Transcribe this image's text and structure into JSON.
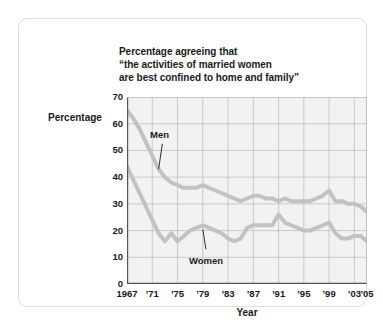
{
  "card": {
    "accent_line_color": "#b3b3b3",
    "plot_bg": "#f2f2f2",
    "grid_color": "#b9b9b9"
  },
  "chart_data": {
    "type": "line",
    "title_lines": [
      "Percentage agreeing that",
      "“the activities of married women",
      "are best confined to home and family”"
    ],
    "xlabel": "Year",
    "ylabel": "Percentage",
    "xlim": [
      1967,
      2005
    ],
    "ylim": [
      0,
      70
    ],
    "yticks": [
      70,
      60,
      50,
      40,
      30,
      20,
      10,
      0
    ],
    "ytick_labels": [
      "70",
      "60",
      "50",
      "40",
      "30",
      "20",
      "10",
      "0"
    ],
    "xticks": [
      1967,
      1971,
      1975,
      1979,
      1983,
      1987,
      1991,
      1995,
      1999,
      2003,
      2005
    ],
    "xtick_labels": [
      "1967",
      "’71",
      "’75",
      "’79",
      "’83",
      "’87",
      "’91",
      "’95",
      "’99",
      "’03",
      "’05"
    ],
    "grid": true,
    "grid_x_every": 4,
    "grid_y_every": 10,
    "legend_position": "inline-annotations",
    "annotations": [
      {
        "text": "Men",
        "x": 1972.6,
        "y": 52.5,
        "leader_to_x": 1972.0,
        "leader_to_y": 43.0
      },
      {
        "text": "Women",
        "x": 1979.5,
        "y": 13.0,
        "leader_to_x": 1979.0,
        "leader_to_y": 20.5
      }
    ],
    "series": [
      {
        "name": "Men",
        "color": "#c2c2c2",
        "x": [
          1967,
          1968,
          1969,
          1970,
          1971,
          1972,
          1973,
          1974,
          1975,
          1976,
          1977,
          1978,
          1979,
          1980,
          1981,
          1982,
          1983,
          1984,
          1985,
          1986,
          1987,
          1988,
          1989,
          1990,
          1991,
          1992,
          1993,
          1994,
          1995,
          1996,
          1997,
          1998,
          1999,
          2000,
          2001,
          2002,
          2003,
          2004,
          2005
        ],
        "values": [
          65,
          62,
          58,
          53,
          48,
          43,
          40,
          38,
          37,
          36,
          36,
          36,
          37,
          36,
          35,
          34,
          33,
          32,
          31,
          32,
          33,
          33,
          32,
          32,
          31,
          32,
          31,
          31,
          31,
          31,
          32,
          33,
          35,
          31,
          31,
          30,
          30,
          29,
          27
        ]
      },
      {
        "name": "Women",
        "color": "#c2c2c2",
        "x": [
          1967,
          1968,
          1969,
          1970,
          1971,
          1972,
          1973,
          1974,
          1975,
          1976,
          1977,
          1978,
          1979,
          1980,
          1981,
          1982,
          1983,
          1984,
          1985,
          1986,
          1987,
          1988,
          1989,
          1990,
          1991,
          1992,
          1993,
          1994,
          1995,
          1996,
          1997,
          1998,
          1999,
          2000,
          2001,
          2002,
          2003,
          2004,
          2005
        ],
        "values": [
          44,
          39,
          34,
          29,
          24,
          19,
          16,
          19,
          16,
          18,
          20,
          21,
          22,
          21,
          20,
          19,
          17,
          16,
          17,
          21,
          22,
          22,
          22,
          22,
          26,
          23,
          22,
          21,
          20,
          20,
          21,
          22,
          23,
          19,
          17,
          17,
          18,
          18,
          16
        ]
      }
    ]
  }
}
